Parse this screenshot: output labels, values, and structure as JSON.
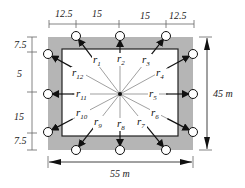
{
  "diagram": {
    "colors": {
      "outer_fill": "#b5b5b5",
      "inner_fill": "#ffffff",
      "inner_stroke": "#222222",
      "ray_color": "#777777",
      "arrow_color": "#111111",
      "dim_color": "#666666"
    },
    "outer_rect": {
      "x": 48,
      "y": 37,
      "w": 145,
      "h": 113
    },
    "inner_rect": {
      "x": 62,
      "y": 49,
      "w": 116,
      "h": 87
    },
    "center": {
      "x": 120,
      "y": 94
    },
    "top_dimensions": {
      "y": 24,
      "ticks": [
        49,
        76,
        119,
        166,
        194
      ],
      "labels": [
        "12.5",
        "15",
        "15",
        "12.5"
      ]
    },
    "left_dimensions": {
      "x": 32,
      "ticks": [
        37,
        52,
        92,
        133,
        150
      ],
      "labels": [
        "7.5",
        "5",
        "15",
        "7.5"
      ]
    },
    "width_dimension": {
      "label": "55 m",
      "y": 162,
      "x1": 48,
      "x2": 193
    },
    "height_dimension": {
      "label": "45 m",
      "x": 205,
      "y1": 37,
      "y2": 150
    },
    "vectors": [
      {
        "name": "r",
        "sub": "1",
        "end": [
          76,
          36
        ],
        "label_pos": [
          93,
          63
        ]
      },
      {
        "name": "r",
        "sub": "2",
        "end": [
          120,
          36
        ],
        "label_pos": [
          117,
          62
        ]
      },
      {
        "name": "r",
        "sub": "3",
        "end": [
          166,
          36
        ],
        "label_pos": [
          142,
          63
        ]
      },
      {
        "name": "r",
        "sub": "4",
        "end": [
          193,
          54
        ],
        "label_pos": [
          156,
          76
        ]
      },
      {
        "name": "r",
        "sub": "5",
        "end": [
          193,
          94
        ],
        "label_pos": [
          149,
          97
        ]
      },
      {
        "name": "r",
        "sub": "6",
        "end": [
          193,
          132
        ],
        "label_pos": [
          151,
          116
        ]
      },
      {
        "name": "r",
        "sub": "7",
        "end": [
          166,
          150
        ],
        "label_pos": [
          137,
          125
        ]
      },
      {
        "name": "r",
        "sub": "8",
        "end": [
          120,
          150
        ],
        "label_pos": [
          117,
          127
        ]
      },
      {
        "name": "r",
        "sub": "9",
        "end": [
          76,
          150
        ],
        "label_pos": [
          94,
          125
        ]
      },
      {
        "name": "r",
        "sub": "10",
        "end": [
          48,
          132
        ],
        "label_pos": [
          76,
          116
        ]
      },
      {
        "name": "r",
        "sub": "11",
        "end": [
          48,
          94
        ],
        "label_pos": [
          76,
          97
        ]
      },
      {
        "name": "r",
        "sub": "12",
        "end": [
          48,
          54
        ],
        "label_pos": [
          72,
          76
        ]
      }
    ]
  },
  "texts": {
    "top_dim_1": "12.5",
    "top_dim_2": "15",
    "top_dim_3": "15",
    "top_dim_4": "12.5",
    "left_dim_1": "7.5",
    "left_dim_2": "5",
    "left_dim_3": "15",
    "left_dim_4": "7.5",
    "width_label": "55 m",
    "height_label": "45 m",
    "r_base": "r",
    "r1": "1",
    "r2": "2",
    "r3": "3",
    "r4": "4",
    "r5": "5",
    "r6": "6",
    "r7": "7",
    "r8": "8",
    "r9": "9",
    "r10": "10",
    "r11": "11",
    "r12": "12"
  }
}
